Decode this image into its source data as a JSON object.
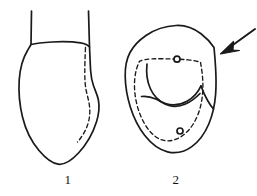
{
  "figure": {
    "type": "line-drawing",
    "background_color": "#ffffff",
    "ink_color": "#1a1a1a",
    "panel_count": 2,
    "panels": [
      {
        "id": "panel-1",
        "label": "1",
        "label_position": {
          "x": 58,
          "y": 173
        },
        "description": "Rounded shield-shaped outline with two short vertical stalk lines rising from the top and a dashed contour following the inner right margin",
        "elements": [
          {
            "name": "outer-outline",
            "style": "solid",
            "stroke_width": 1.6
          },
          {
            "name": "left-stalk-line",
            "style": "solid",
            "stroke_width": 1.6
          },
          {
            "name": "right-stalk-line",
            "style": "solid",
            "stroke_width": 1.6
          },
          {
            "name": "right-margin-dashed-contour",
            "style": "dashed",
            "stroke_width": 1.3,
            "dash_pattern": "4 3"
          }
        ]
      },
      {
        "id": "panel-2",
        "label": "2",
        "label_position": {
          "x": 166,
          "y": 173
        },
        "description": "Ovate outline enclosing a dashed inner contour, two interior solid arcs, two small ring markers on the dashed contour, and an arrow indicating the right lateral margin",
        "elements": [
          {
            "name": "outer-outline",
            "style": "solid",
            "stroke_width": 1.6
          },
          {
            "name": "inner-dashed-contour",
            "style": "dashed",
            "stroke_width": 1.3,
            "dash_pattern": "4 3"
          },
          {
            "name": "upper-interior-arc",
            "style": "solid",
            "stroke_width": 1.6
          },
          {
            "name": "lower-interior-arc",
            "style": "solid",
            "stroke_width": 1.6
          },
          {
            "name": "right-interior-fold-line",
            "style": "solid",
            "stroke_width": 1.6
          },
          {
            "name": "upper-ring-marker",
            "style": "solid",
            "center": {
              "x": 177,
              "y": 59
            },
            "radius": 3
          },
          {
            "name": "lower-ring-marker",
            "style": "solid",
            "center": {
              "x": 180,
              "y": 131
            },
            "radius": 3
          },
          {
            "name": "pointer-arrow",
            "style": "solid",
            "from": {
              "x": 254,
              "y": 30
            },
            "to": {
              "x": 222,
              "y": 52
            }
          }
        ]
      }
    ]
  }
}
